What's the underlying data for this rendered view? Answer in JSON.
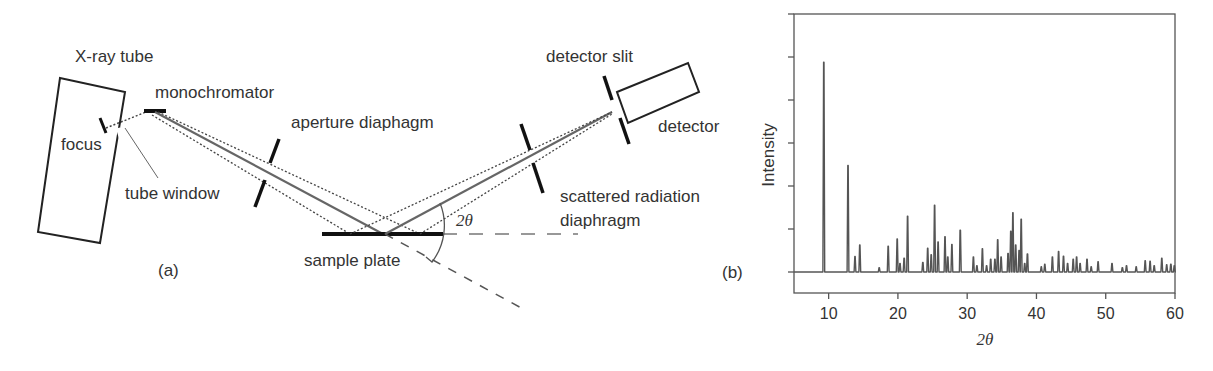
{
  "figure_a": {
    "panel_label": "(a)",
    "labels": {
      "xray_tube": "X-ray tube",
      "focus": "focus",
      "tube_window": "tube window",
      "monochromator": "monochromator",
      "aperture_diaphragm": "aperture diaphagm",
      "sample_plate": "sample plate",
      "two_theta": "2θ",
      "scattered_line1": "scattered radiation",
      "scattered_line2": "diaphragm",
      "detector_slit": "detector slit",
      "detector": "detector"
    },
    "colors": {
      "beam": "#666666",
      "outline": "#222222"
    }
  },
  "figure_b": {
    "panel_label": "(b)"
  },
  "chart_data": {
    "type": "line",
    "title": "",
    "xlabel": "2θ",
    "ylabel": "Intensity",
    "xlim": [
      5,
      60
    ],
    "ylim": [
      -0.5,
      6
    ],
    "x_ticks": [
      10,
      20,
      30,
      40,
      50,
      60
    ],
    "y_ticks_unlabeled": [
      0,
      1,
      2,
      3,
      4,
      5,
      6
    ],
    "grid": false,
    "legend": null,
    "line_color": "#555555",
    "peaks": [
      {
        "x": 9.3,
        "y": 4.88
      },
      {
        "x": 12.8,
        "y": 2.48
      },
      {
        "x": 13.8,
        "y": 0.36
      },
      {
        "x": 14.5,
        "y": 0.63
      },
      {
        "x": 17.3,
        "y": 0.1
      },
      {
        "x": 18.6,
        "y": 0.6
      },
      {
        "x": 19.9,
        "y": 0.77
      },
      {
        "x": 20.3,
        "y": 0.2
      },
      {
        "x": 20.9,
        "y": 0.32
      },
      {
        "x": 21.4,
        "y": 1.3
      },
      {
        "x": 23.6,
        "y": 0.22
      },
      {
        "x": 24.3,
        "y": 0.55
      },
      {
        "x": 24.8,
        "y": 0.4
      },
      {
        "x": 25.3,
        "y": 1.55
      },
      {
        "x": 25.8,
        "y": 0.7
      },
      {
        "x": 26.8,
        "y": 0.82
      },
      {
        "x": 27.2,
        "y": 0.35
      },
      {
        "x": 27.8,
        "y": 0.64
      },
      {
        "x": 29.0,
        "y": 0.97
      },
      {
        "x": 30.9,
        "y": 0.35
      },
      {
        "x": 31.4,
        "y": 0.15
      },
      {
        "x": 32.2,
        "y": 0.54
      },
      {
        "x": 32.8,
        "y": 0.15
      },
      {
        "x": 33.4,
        "y": 0.3
      },
      {
        "x": 34.0,
        "y": 0.3
      },
      {
        "x": 34.4,
        "y": 0.75
      },
      {
        "x": 34.9,
        "y": 0.35
      },
      {
        "x": 35.9,
        "y": 0.43
      },
      {
        "x": 36.3,
        "y": 0.95
      },
      {
        "x": 36.6,
        "y": 1.38
      },
      {
        "x": 37.0,
        "y": 0.63
      },
      {
        "x": 37.5,
        "y": 0.5
      },
      {
        "x": 37.8,
        "y": 1.23
      },
      {
        "x": 38.3,
        "y": 0.2
      },
      {
        "x": 38.7,
        "y": 0.42
      },
      {
        "x": 40.7,
        "y": 0.12
      },
      {
        "x": 41.2,
        "y": 0.18
      },
      {
        "x": 42.3,
        "y": 0.35
      },
      {
        "x": 43.2,
        "y": 0.48
      },
      {
        "x": 43.9,
        "y": 0.37
      },
      {
        "x": 44.5,
        "y": 0.2
      },
      {
        "x": 45.3,
        "y": 0.3
      },
      {
        "x": 45.8,
        "y": 0.35
      },
      {
        "x": 46.3,
        "y": 0.2
      },
      {
        "x": 47.3,
        "y": 0.3
      },
      {
        "x": 47.9,
        "y": 0.12
      },
      {
        "x": 48.9,
        "y": 0.24
      },
      {
        "x": 50.9,
        "y": 0.2
      },
      {
        "x": 52.4,
        "y": 0.1
      },
      {
        "x": 53.0,
        "y": 0.15
      },
      {
        "x": 54.4,
        "y": 0.12
      },
      {
        "x": 55.7,
        "y": 0.26
      },
      {
        "x": 56.4,
        "y": 0.25
      },
      {
        "x": 57.0,
        "y": 0.15
      },
      {
        "x": 58.1,
        "y": 0.32
      },
      {
        "x": 58.8,
        "y": 0.17
      },
      {
        "x": 59.4,
        "y": 0.18
      },
      {
        "x": 59.9,
        "y": 0.15
      }
    ]
  }
}
